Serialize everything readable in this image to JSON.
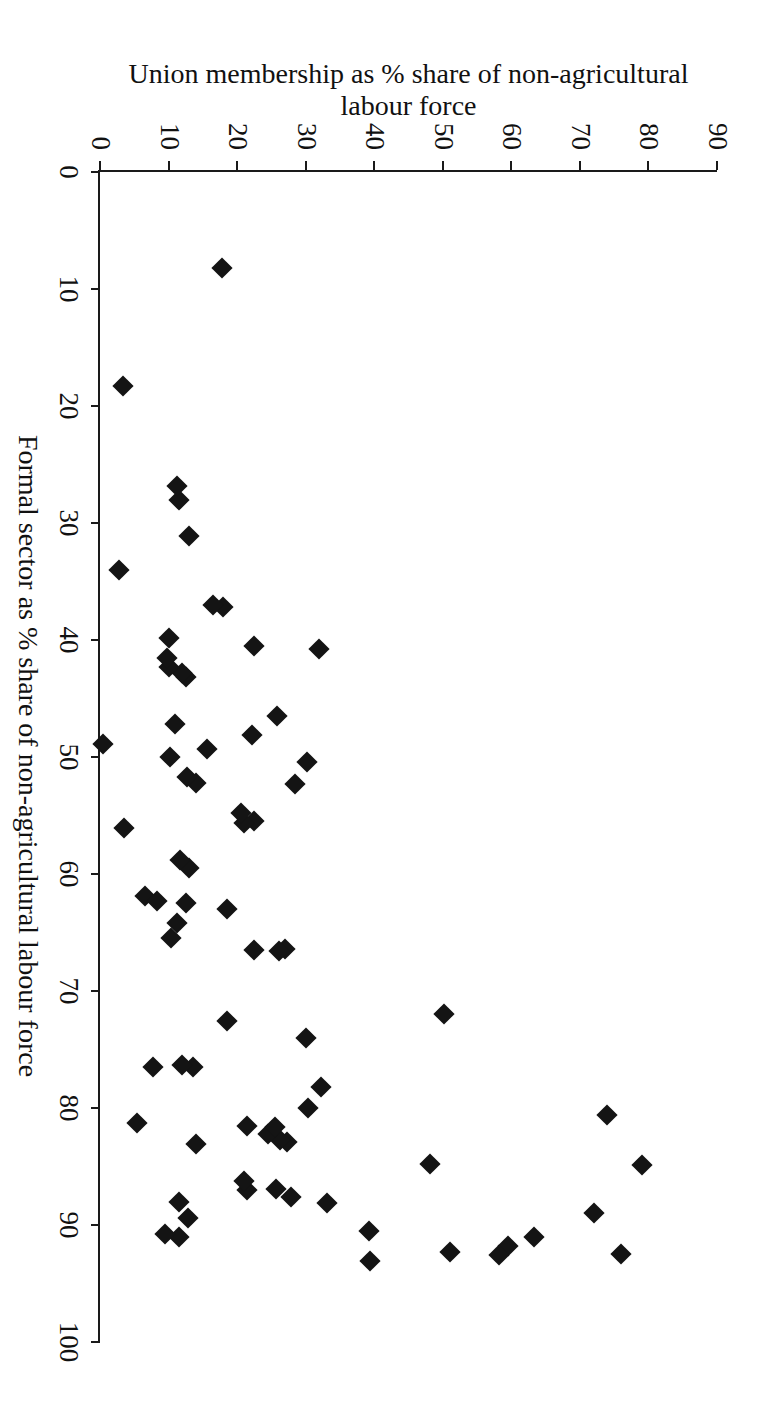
{
  "figure": {
    "background_color": "#ffffff",
    "ink_color": "#141414",
    "rotation_note": "plot printed rotated 90 degrees clockwise on the page"
  },
  "chart_data": {
    "type": "scatter",
    "title": "",
    "xlabel": "Formal sector as % share of non-agricultural labour force",
    "ylabel": "Union membership as % share of non-agricultural\nlabour force",
    "xlim": [
      0,
      100
    ],
    "ylim": [
      0,
      90
    ],
    "xticks": [
      0,
      10,
      20,
      30,
      40,
      50,
      60,
      70,
      80,
      90,
      100
    ],
    "xticklabels": [
      "0",
      "10",
      "20",
      "30",
      "40",
      "50",
      "60",
      "70",
      "80",
      "90",
      "100"
    ],
    "yticks": [
      0,
      10,
      20,
      30,
      40,
      50,
      60,
      70,
      80,
      90
    ],
    "yticklabels": [
      "0",
      "10",
      "20",
      "30",
      "40",
      "50",
      "60",
      "70",
      "80",
      "90"
    ],
    "grid": false,
    "legend": false,
    "marker": "diamond",
    "marker_color": "#141414",
    "points": [
      {
        "x": 92.5,
        "y": 76.0
      },
      {
        "x": 89.0,
        "y": 72.0
      },
      {
        "x": 91.0,
        "y": 63.3
      },
      {
        "x": 91.8,
        "y": 59.5
      },
      {
        "x": 92.6,
        "y": 58.2
      },
      {
        "x": 92.3,
        "y": 51.0
      },
      {
        "x": 84.9,
        "y": 79.0
      },
      {
        "x": 80.6,
        "y": 74.0
      },
      {
        "x": 84.8,
        "y": 48.1
      },
      {
        "x": 93.1,
        "y": 39.4
      },
      {
        "x": 90.5,
        "y": 39.2
      },
      {
        "x": 88.1,
        "y": 33.1
      },
      {
        "x": 87.6,
        "y": 27.9
      },
      {
        "x": 86.9,
        "y": 25.6
      },
      {
        "x": 87.0,
        "y": 21.4
      },
      {
        "x": 86.2,
        "y": 21.0
      },
      {
        "x": 89.4,
        "y": 12.8
      },
      {
        "x": 88.0,
        "y": 11.5
      },
      {
        "x": 91.0,
        "y": 11.5
      },
      {
        "x": 90.8,
        "y": 9.5
      },
      {
        "x": 72.0,
        "y": 50.2
      },
      {
        "x": 82.9,
        "y": 27.3
      },
      {
        "x": 82.7,
        "y": 26.2
      },
      {
        "x": 82.2,
        "y": 24.5
      },
      {
        "x": 81.5,
        "y": 21.5
      },
      {
        "x": 83.1,
        "y": 14.0
      },
      {
        "x": 81.3,
        "y": 5.4
      },
      {
        "x": 81.6,
        "y": 25.5
      },
      {
        "x": 78.2,
        "y": 32.3
      },
      {
        "x": 80.0,
        "y": 30.4
      },
      {
        "x": 76.5,
        "y": 13.5
      },
      {
        "x": 76.3,
        "y": 12.0
      },
      {
        "x": 76.5,
        "y": 7.7
      },
      {
        "x": 74.0,
        "y": 30.0
      },
      {
        "x": 72.6,
        "y": 18.5
      },
      {
        "x": 66.4,
        "y": 27.0
      },
      {
        "x": 66.6,
        "y": 26.1
      },
      {
        "x": 66.5,
        "y": 22.4
      },
      {
        "x": 63.0,
        "y": 18.5
      },
      {
        "x": 65.5,
        "y": 10.3
      },
      {
        "x": 64.2,
        "y": 11.3
      },
      {
        "x": 62.5,
        "y": 12.6
      },
      {
        "x": 61.9,
        "y": 6.5
      },
      {
        "x": 62.3,
        "y": 8.3
      },
      {
        "x": 59.5,
        "y": 13.0
      },
      {
        "x": 58.8,
        "y": 11.6
      },
      {
        "x": 56.1,
        "y": 3.5
      },
      {
        "x": 55.5,
        "y": 22.5
      },
      {
        "x": 55.6,
        "y": 21.0
      },
      {
        "x": 54.8,
        "y": 20.5
      },
      {
        "x": 52.3,
        "y": 28.5
      },
      {
        "x": 52.2,
        "y": 14.0
      },
      {
        "x": 51.7,
        "y": 12.7
      },
      {
        "x": 50.4,
        "y": 30.2
      },
      {
        "x": 50.0,
        "y": 10.2
      },
      {
        "x": 49.3,
        "y": 15.6
      },
      {
        "x": 48.9,
        "y": 0.5
      },
      {
        "x": 48.1,
        "y": 22.1
      },
      {
        "x": 47.2,
        "y": 11.0
      },
      {
        "x": 46.5,
        "y": 25.8
      },
      {
        "x": 43.2,
        "y": 12.5
      },
      {
        "x": 42.8,
        "y": 12.0
      },
      {
        "x": 42.3,
        "y": 10.0
      },
      {
        "x": 41.5,
        "y": 9.8
      },
      {
        "x": 40.8,
        "y": 32.0
      },
      {
        "x": 40.5,
        "y": 22.4
      },
      {
        "x": 39.8,
        "y": 10.0
      },
      {
        "x": 37.2,
        "y": 18.0
      },
      {
        "x": 37.0,
        "y": 16.5
      },
      {
        "x": 34.0,
        "y": 2.7
      },
      {
        "x": 31.1,
        "y": 13.0
      },
      {
        "x": 28.0,
        "y": 11.5
      },
      {
        "x": 26.8,
        "y": 11.2
      },
      {
        "x": 18.3,
        "y": 3.3
      },
      {
        "x": 8.2,
        "y": 17.8
      }
    ]
  },
  "axes": {
    "x": {
      "label": "Formal sector as % share of non-agricultural labour force",
      "ticks": [
        "0",
        "10",
        "20",
        "30",
        "40",
        "50",
        "60",
        "70",
        "80",
        "90",
        "100"
      ]
    },
    "y": {
      "label": "Union membership as % share of non-agricultural\nlabour force",
      "ticks": [
        "0",
        "10",
        "20",
        "30",
        "40",
        "50",
        "60",
        "70",
        "80",
        "90"
      ]
    }
  }
}
